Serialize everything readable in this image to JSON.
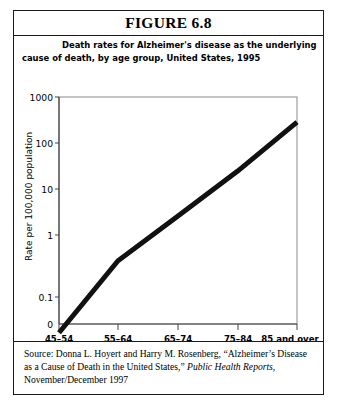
{
  "figure": {
    "header_label": "FIGURE 6.8",
    "subtitle_line1": "Death rates for Alzheimer's disease as the underlying",
    "subtitle_line2": "cause of death, by age group, United States, 1995"
  },
  "source": {
    "prefix": "Source: Donna L. Hoyert and Harry M. Rosenberg, “Alzheimer’s Disease as a Cause of Death in the United States,” ",
    "journal": "Public Health Reports",
    "suffix": ", November/December 1997"
  },
  "axis": {
    "y_label": "Rate per 100,000 population",
    "origin_label": "0",
    "y_ticks": [
      "1000",
      "100",
      "10",
      "1",
      "0.1"
    ],
    "x_ticks": [
      "45–54",
      "55–64",
      "65–74",
      "75–84",
      "85 and over"
    ]
  },
  "colors": {
    "line": "#111111",
    "axis": "#555555",
    "border": "#1a1a1a",
    "background": "#ffffff"
  },
  "chart_data": {
    "type": "line",
    "title": "Death rates for Alzheimer's disease as the underlying cause of death, by age group, United States, 1995",
    "xlabel": "",
    "ylabel": "Rate per 100,000 population",
    "yscale": "log",
    "ylim": [
      0.1,
      1000
    ],
    "ytick_values": [
      1000,
      100,
      10,
      1,
      0.1
    ],
    "ytick_labels": [
      "1000",
      "100",
      "10",
      "1",
      "0.1"
    ],
    "categories": [
      "45–54",
      "55–64",
      "65–74",
      "75–84",
      "85 and over"
    ],
    "values": [
      0.07,
      1.3,
      8,
      50,
      360
    ],
    "series": [
      {
        "name": "Death rate per 100,000 population",
        "values": [
          0.07,
          1.3,
          8,
          50,
          360
        ]
      }
    ],
    "grid": false,
    "legend": "none",
    "line_width_px": 5
  }
}
